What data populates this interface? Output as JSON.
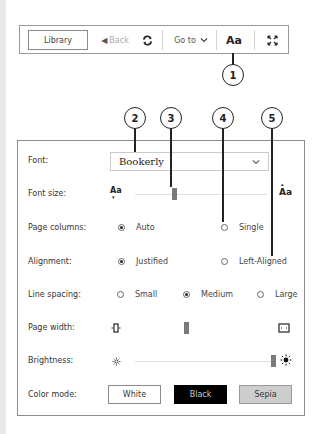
{
  "toolbar": {
    "library": "Library",
    "back": "Back",
    "goto": "Go to",
    "font_button": "Aa",
    "icons": {
      "back": "triangle-left-icon",
      "sync": "sync-icon",
      "goto_chevron": "chevron-down-icon",
      "fullscreen": "fullscreen-icon"
    }
  },
  "callouts": [
    "1",
    "2",
    "3",
    "4",
    "5"
  ],
  "panel": {
    "font": {
      "label": "Font:",
      "value": "Bookerly"
    },
    "font_size": {
      "label": "Font size:",
      "small_icon": "Aa",
      "large_icon": "Aa",
      "thumb_percent": 36
    },
    "page_columns": {
      "label": "Page columns:",
      "options": [
        "Auto",
        "Single"
      ],
      "selected": "Auto"
    },
    "alignment": {
      "label": "Alignment:",
      "options": [
        "Justified",
        "Left-Aligned"
      ],
      "selected": "Justified"
    },
    "line_spacing": {
      "label": "Line spacing:",
      "options": [
        "Small",
        "Medium",
        "Large"
      ],
      "selected": "Medium"
    },
    "page_width": {
      "label": "Page width:",
      "thumb_percent": 38
    },
    "brightness": {
      "label": "Brightness:",
      "thumb_percent": 97
    },
    "color_mode": {
      "label": "Color mode:",
      "options": [
        "White",
        "Black",
        "Sepia"
      ]
    }
  },
  "colors": {
    "black_mode": "#000000",
    "sepia_mode": "#cdcdcd",
    "thumb": "#7a7a7a"
  }
}
